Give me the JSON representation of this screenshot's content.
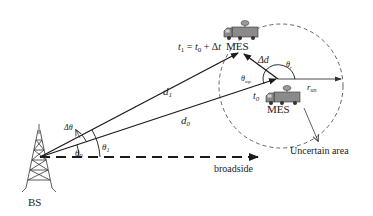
{
  "diagram": {
    "nodes": {
      "bs": {
        "label": "BS"
      },
      "mes_t0": {
        "label": "MES",
        "time_label": "t",
        "time_sub": "0"
      },
      "mes_t1": {
        "label": "MES",
        "time_eq": {
          "lhs": "t",
          "lhs_sub": "1",
          "eq": " = ",
          "t0": "t",
          "t0_sub": "0",
          "plus": " + Δ",
          "dt": "t"
        }
      }
    },
    "edges": {
      "d0": {
        "label": "d",
        "sub": "0"
      },
      "d1": {
        "label": "d",
        "sub": "1"
      },
      "delta_d": {
        "label": "Δd"
      },
      "r_un": {
        "label": "r",
        "sub": "un"
      },
      "broadside": {
        "label": "broadside"
      }
    },
    "angles": {
      "theta0": {
        "label": "θ",
        "sub": "0"
      },
      "theta1": {
        "label": "θ",
        "sub": "1"
      },
      "delta_theta": {
        "label": "Δθ"
      },
      "theta_mp": {
        "label": "θ",
        "sub": "mp"
      },
      "theta_r": {
        "label": "θ",
        "sub": "r"
      }
    },
    "regions": {
      "uncertain_area": {
        "label": "Uncertain area"
      }
    },
    "colors": {
      "line": "#1a1a1a",
      "dashed": "#555555",
      "truck_body": "#8a8a8a",
      "truck_dark": "#333333"
    }
  }
}
